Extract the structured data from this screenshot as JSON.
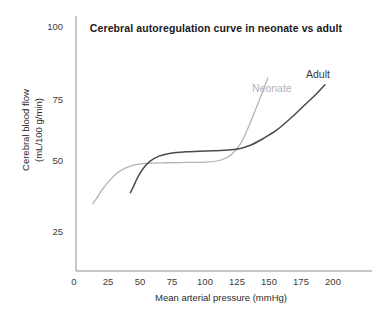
{
  "chart_data": {
    "type": "line",
    "title": "Cerebral autoregulation curve in neonate vs adult",
    "xlabel": "Mean arterial pressure (mmHg)",
    "ylabel_line1": "Cerebral blood flow",
    "ylabel_line2": "(mL/100 g/min)",
    "xlim": [
      0,
      200
    ],
    "ylim": [
      0,
      100
    ],
    "xticks": [
      0,
      25,
      50,
      75,
      100,
      125,
      150,
      175,
      200
    ],
    "xtick_labels": [
      "0",
      "25",
      "50",
      "75",
      "100",
      "125",
      "150",
      "175",
      "200"
    ],
    "yticks": [
      25,
      50,
      75,
      100
    ],
    "ytick_labels": [
      "25",
      "50",
      "75",
      "100"
    ],
    "grid": false,
    "legend_position": "inline-annotations",
    "series": [
      {
        "name": "Neonate",
        "color": "#b3b3b3",
        "annotation": "Neonate",
        "points": [
          [
            13,
            34
          ],
          [
            16,
            36
          ],
          [
            20,
            39
          ],
          [
            25,
            42
          ],
          [
            31,
            45
          ],
          [
            38,
            47
          ],
          [
            46,
            48.3
          ],
          [
            55,
            48.8
          ],
          [
            70,
            49
          ],
          [
            85,
            49.1
          ],
          [
            100,
            49.2
          ],
          [
            112,
            50
          ],
          [
            120,
            52
          ],
          [
            127,
            56
          ],
          [
            133,
            62
          ],
          [
            139,
            69
          ],
          [
            144,
            75
          ],
          [
            148,
            80
          ]
        ]
      },
      {
        "name": "Adult",
        "color": "#4a4a4a",
        "annotation": "Adult",
        "points": [
          [
            42,
            38
          ],
          [
            45,
            41
          ],
          [
            48,
            44
          ],
          [
            52,
            47
          ],
          [
            57,
            49.5
          ],
          [
            64,
            51.4
          ],
          [
            72,
            52.4
          ],
          [
            85,
            53
          ],
          [
            100,
            53.3
          ],
          [
            115,
            53.6
          ],
          [
            125,
            54
          ],
          [
            135,
            55.5
          ],
          [
            145,
            58
          ],
          [
            155,
            61
          ],
          [
            165,
            65
          ],
          [
            175,
            69.5
          ],
          [
            185,
            74
          ],
          [
            192,
            77.5
          ]
        ]
      }
    ]
  },
  "axes_style": {
    "axis_color": "#8a8a8a"
  }
}
